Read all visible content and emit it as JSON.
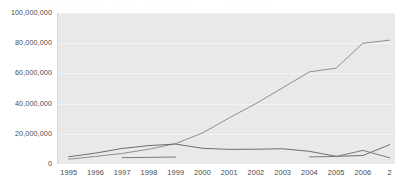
{
  "chart_data": {
    "type": "line",
    "title": "",
    "subtitle": "",
    "xlabel": "",
    "ylabel": "",
    "grid": true,
    "legend_position": "none",
    "xlim": [
      1994.6,
      2007.2
    ],
    "ylim": [
      0,
      100000000
    ],
    "yticks": [
      0,
      20000000,
      40000000,
      60000000,
      80000000,
      100000000
    ],
    "ytick_labels": [
      "0",
      "20,000,000",
      "40,000,000",
      "60,000,000",
      "80,000,000",
      "100,000,000"
    ],
    "x": [
      1995,
      1996,
      1997,
      1998,
      1999,
      2000,
      2001,
      2002,
      2003,
      2004,
      2005,
      2006,
      2007
    ],
    "xtick_labels": [
      "1995",
      "1996",
      "1997",
      "1998",
      "1999",
      "2000",
      "2001",
      "2002",
      "2003",
      "2004",
      "2005",
      "2006",
      "2"
    ],
    "series": [
      {
        "name": "series-1",
        "color": "#8f8f8f",
        "values": [
          3200000,
          5000000,
          7000000,
          9800000,
          13500000,
          20500000,
          30500000,
          40000000,
          50500000,
          61000000,
          63500000,
          80000000,
          82000000
        ]
      },
      {
        "name": "series-2",
        "color": "#6e6e6e",
        "values": [
          4800000,
          7200000,
          10300000,
          12200000,
          13200000,
          10400000,
          9700000,
          9800000,
          10100000,
          8400000,
          5100000,
          5600000,
          12800000
        ]
      },
      {
        "name": "series-3",
        "color": "#7a7a7a",
        "values": [
          null,
          null,
          4200000,
          4400000,
          4600000,
          null,
          null,
          null,
          null,
          4700000,
          5000000,
          9000000,
          4100000
        ]
      }
    ]
  }
}
